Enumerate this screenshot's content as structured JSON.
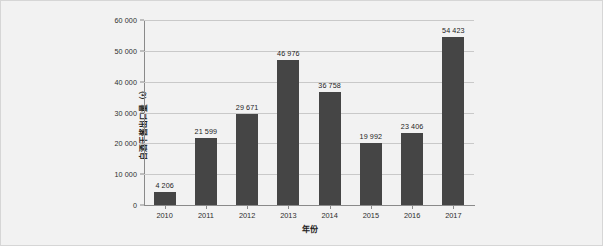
{
  "chart_data": {
    "type": "bar",
    "title": "",
    "subtitle": "",
    "xlabel": "年份",
    "ylabel": "白酒干酱出口量（t）",
    "categories": [
      "2010",
      "2011",
      "2012",
      "2013",
      "2014",
      "2015",
      "2016",
      "2017"
    ],
    "values": [
      4206,
      21599,
      29671,
      46976,
      36758,
      19992,
      23406,
      54423
    ],
    "value_labels": [
      "4 206",
      "21 599",
      "29 671",
      "46 976",
      "36 758",
      "19 992",
      "23 406",
      "54 423"
    ],
    "ylim": [
      0,
      60000
    ],
    "y_ticks": [
      0,
      10000,
      20000,
      30000,
      40000,
      50000,
      60000
    ],
    "y_tick_labels": [
      "0",
      "10 000",
      "20 000",
      "30 000",
      "40 000",
      "50 000",
      "60 000"
    ],
    "grid": true,
    "grid_axis": "y",
    "legend": false,
    "legend_position": "none",
    "bar_color": "#454545",
    "background_color": "#f2f2f2",
    "gridline_color": "#c9c9c9",
    "axis_color": "#8a8a8a",
    "text_color": "#1d1d1d"
  },
  "caption": {
    "text": ""
  }
}
